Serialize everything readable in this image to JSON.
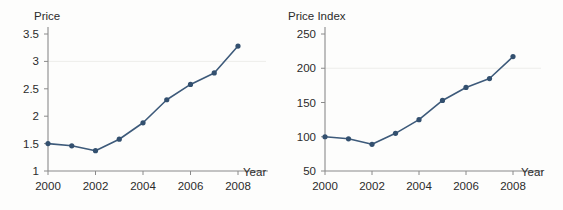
{
  "figure": {
    "background_color": "#fdfdfc",
    "series_color": "#3d5a7a",
    "marker_color": "#33506f",
    "axis_color": "#8a8a8a",
    "grid_color": "#ededea"
  },
  "charts": [
    {
      "id": "price-chart",
      "type": "line",
      "title": "",
      "ylabel": "Price",
      "xlabel": "Year",
      "x": [
        2000,
        2001,
        2002,
        2003,
        2004,
        2005,
        2006,
        2007,
        2008
      ],
      "values": [
        1.5,
        1.46,
        1.37,
        1.58,
        1.88,
        2.3,
        2.58,
        2.79,
        3.28
      ],
      "series": [
        {
          "name": "Price",
          "values": [
            1.5,
            1.46,
            1.37,
            1.58,
            1.88,
            2.3,
            2.58,
            2.79,
            3.28
          ]
        }
      ],
      "xlim": [
        2000,
        2008
      ],
      "ylim": [
        1,
        3.5
      ],
      "yticks": [
        1,
        1.5,
        2,
        2.5,
        3,
        3.5
      ],
      "ytick_labels": [
        "1",
        "1.5",
        "2",
        "2.5",
        "3",
        "3.5"
      ],
      "xticks": [
        2000,
        2002,
        2004,
        2006,
        2008
      ],
      "xtick_labels": [
        "2000",
        "2002",
        "2004",
        "2006",
        "2008"
      ],
      "gridlines_y": [
        3
      ],
      "grid": "faint-horizontal",
      "legend": "none"
    },
    {
      "id": "price-index-chart",
      "type": "line",
      "title": "",
      "ylabel": "Price Index",
      "xlabel": "Year",
      "x": [
        2000,
        2001,
        2002,
        2003,
        2004,
        2005,
        2006,
        2007,
        2008
      ],
      "values": [
        100,
        97,
        89,
        105,
        125,
        153,
        172,
        185,
        217
      ],
      "series": [
        {
          "name": "Price Index",
          "values": [
            100,
            97,
            89,
            105,
            125,
            153,
            172,
            185,
            217
          ]
        }
      ],
      "xlim": [
        2000,
        2008
      ],
      "ylim": [
        50,
        250
      ],
      "yticks": [
        50,
        100,
        150,
        200,
        250
      ],
      "ytick_labels": [
        "50",
        "100",
        "150",
        "200",
        "250"
      ],
      "xticks": [
        2000,
        2002,
        2004,
        2006,
        2008
      ],
      "xtick_labels": [
        "2000",
        "2002",
        "2004",
        "2006",
        "2008"
      ],
      "gridlines_y": [
        200
      ],
      "grid": "faint-horizontal",
      "legend": "none"
    }
  ],
  "chart_data": [
    {
      "type": "line",
      "title": "",
      "xlabel": "Year",
      "ylabel": "Price",
      "x": [
        2000,
        2001,
        2002,
        2003,
        2004,
        2005,
        2006,
        2007,
        2008
      ],
      "values": [
        1.5,
        1.46,
        1.37,
        1.58,
        1.88,
        2.3,
        2.58,
        2.79,
        3.28
      ],
      "categories": [
        "2000",
        "2001",
        "2002",
        "2003",
        "2004",
        "2005",
        "2006",
        "2007",
        "2008"
      ],
      "xlim": [
        2000,
        2008
      ],
      "ylim": [
        1,
        3.5
      ],
      "yticks": [
        1,
        1.5,
        2,
        2.5,
        3,
        3.5
      ],
      "xticks": [
        2000,
        2002,
        2004,
        2006,
        2008
      ],
      "grid": "faint horizontal gridline at y=3",
      "legend": "none",
      "series": [
        {
          "name": "Price",
          "values": [
            1.5,
            1.46,
            1.37,
            1.58,
            1.88,
            2.3,
            2.58,
            2.79,
            3.28
          ]
        }
      ]
    },
    {
      "type": "line",
      "title": "",
      "xlabel": "Year",
      "ylabel": "Price Index",
      "x": [
        2000,
        2001,
        2002,
        2003,
        2004,
        2005,
        2006,
        2007,
        2008
      ],
      "values": [
        100,
        97,
        89,
        105,
        125,
        153,
        172,
        185,
        217
      ],
      "categories": [
        "2000",
        "2001",
        "2002",
        "2003",
        "2004",
        "2005",
        "2006",
        "2007",
        "2008"
      ],
      "xlim": [
        2000,
        2008
      ],
      "ylim": [
        50,
        250
      ],
      "yticks": [
        50,
        100,
        150,
        200,
        250
      ],
      "xticks": [
        2000,
        2002,
        2004,
        2006,
        2008
      ],
      "grid": "faint horizontal gridline at y=200",
      "legend": "none",
      "series": [
        {
          "name": "Price Index",
          "values": [
            100,
            97,
            89,
            105,
            125,
            153,
            172,
            185,
            217
          ]
        }
      ]
    }
  ]
}
